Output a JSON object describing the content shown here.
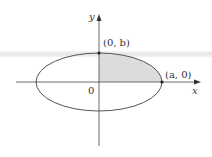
{
  "figure": {
    "type": "ellipse-quadrant-diagram",
    "axes": {
      "x_label": "x",
      "y_label": "y",
      "origin_label": "0"
    },
    "points": [
      {
        "label": "(0, b)",
        "x": 0,
        "y": "b"
      },
      {
        "label": "(a, 0)",
        "x": "a",
        "y": 0
      }
    ],
    "shaded_region": "first quadrant of ellipse",
    "colors": {
      "curve": "#555555",
      "axes": "#444444",
      "shade": "#dcdcdc",
      "band": "#e8e8e8"
    }
  },
  "labels": {
    "y_axis": "y",
    "x_axis": "x",
    "origin": "0",
    "top_point": "(0, b)",
    "right_point": "(a, 0)"
  }
}
